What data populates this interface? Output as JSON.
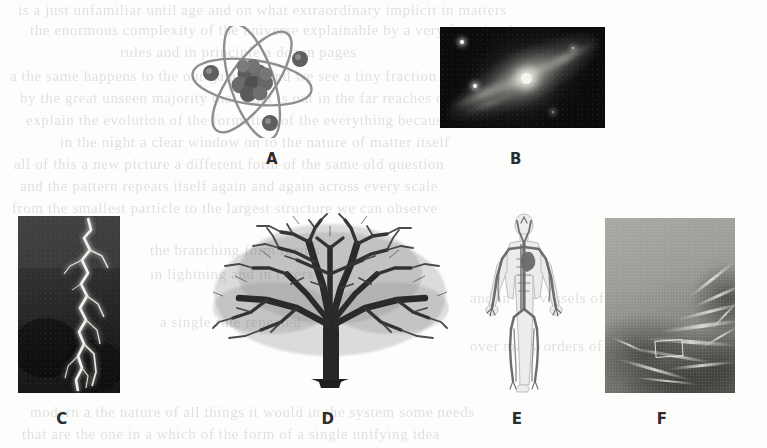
{
  "figure": {
    "background_color": "#fdfdfc",
    "panels": [
      {
        "id": "A",
        "label": "A",
        "subject": "atom-diagram",
        "description": "Atom with dense nucleus of clustered protons and neutrons and three electrons on elliptical orbits",
        "kind": "illustration",
        "scale": "atomic",
        "bounds": {
          "x": 186,
          "y": 26,
          "width": 132,
          "height": 112
        },
        "label_position": {
          "x": 272,
          "y": 158
        }
      },
      {
        "id": "B",
        "label": "B",
        "subject": "galaxy-photograph",
        "description": "Grainy black-and-white telescope photograph of a spiral galaxy with a bright core and two foreground stars",
        "kind": "photograph",
        "scale": "cosmic",
        "bounds": {
          "x": 440,
          "y": 27,
          "width": 165,
          "height": 101
        },
        "label_position": {
          "x": 516,
          "y": 158
        }
      },
      {
        "id": "C",
        "label": "C",
        "subject": "lightning-photograph",
        "description": "Forked lightning bolt branching downward across a dark night sky",
        "kind": "photograph",
        "scale": "atmospheric",
        "bounds": {
          "x": 18,
          "y": 216,
          "width": 102,
          "height": 177
        },
        "label_position": {
          "x": 62,
          "y": 418
        }
      },
      {
        "id": "D",
        "label": "D",
        "subject": "tree-silhouette",
        "description": "Leafless broad-crowned deciduous tree showing a fractal branching pattern",
        "kind": "photograph",
        "scale": "organism",
        "bounds": {
          "x": 211,
          "y": 212,
          "width": 238,
          "height": 183
        },
        "label_position": {
          "x": 328,
          "y": 418
        }
      },
      {
        "id": "E",
        "label": "E",
        "subject": "human-circulatory-system-diagram",
        "description": "Front view of a human body showing the branching network of arteries and veins",
        "kind": "illustration",
        "scale": "human",
        "bounds": {
          "x": 483,
          "y": 213,
          "width": 82,
          "height": 180
        },
        "label_position": {
          "x": 517,
          "y": 418
        }
      },
      {
        "id": "F",
        "label": "F",
        "subject": "root-delta-texture-photograph",
        "description": "Grey aerial-style photograph of branching root or river-delta channels spreading across the frame",
        "kind": "photograph",
        "scale": "landscape",
        "bounds": {
          "x": 605,
          "y": 218,
          "width": 130,
          "height": 175
        },
        "label_position": {
          "x": 662,
          "y": 418
        }
      }
    ]
  },
  "bleed_through_text": {
    "note": "Faint ghost text showing through from the reverse side of the scanned page; not legible",
    "lines": [
      {
        "x": 18,
        "y": 2,
        "text": "is a just unfamiliar until age and on what extraordinary implicit in matters"
      },
      {
        "x": 30,
        "y": 22,
        "text": "the enormous complexity of the universe explainable by a very few simple"
      },
      {
        "x": 120,
        "y": 44,
        "text": "rules and in principle a dozen pages"
      },
      {
        "x": 10,
        "y": 68,
        "text": "a the same happens to the our galaxies and we see a tiny fraction"
      },
      {
        "x": 20,
        "y": 90,
        "text": "by the great unseen majority that what is out in the far reaches of a million"
      },
      {
        "x": 26,
        "y": 112,
        "text": "explain the evolution of the formation of the everything because"
      },
      {
        "x": 60,
        "y": 134,
        "text": "in the night a clear window on to the nature of matter itself"
      },
      {
        "x": 14,
        "y": 156,
        "text": "all of this a new picture a different form of the same old question"
      },
      {
        "x": 20,
        "y": 178,
        "text": "and the pattern repeats itself again and again across every scale"
      },
      {
        "x": 12,
        "y": 200,
        "text": "from the smallest particle to the largest structure we can observe"
      },
      {
        "x": 150,
        "y": 242,
        "text": "the branching form recurs"
      },
      {
        "x": 150,
        "y": 266,
        "text": "in lightning and in rivers"
      },
      {
        "x": 470,
        "y": 290,
        "text": "and in the vessels of the body"
      },
      {
        "x": 160,
        "y": 314,
        "text": "a single rule repeated"
      },
      {
        "x": 470,
        "y": 338,
        "text": "over many orders of magnitude"
      },
      {
        "x": 30,
        "y": 404,
        "text": "modern a the nature of all things it would in the system some needs"
      },
      {
        "x": 22,
        "y": 426,
        "text": "that are the one in a which of the form of a single unifying idea"
      }
    ]
  }
}
